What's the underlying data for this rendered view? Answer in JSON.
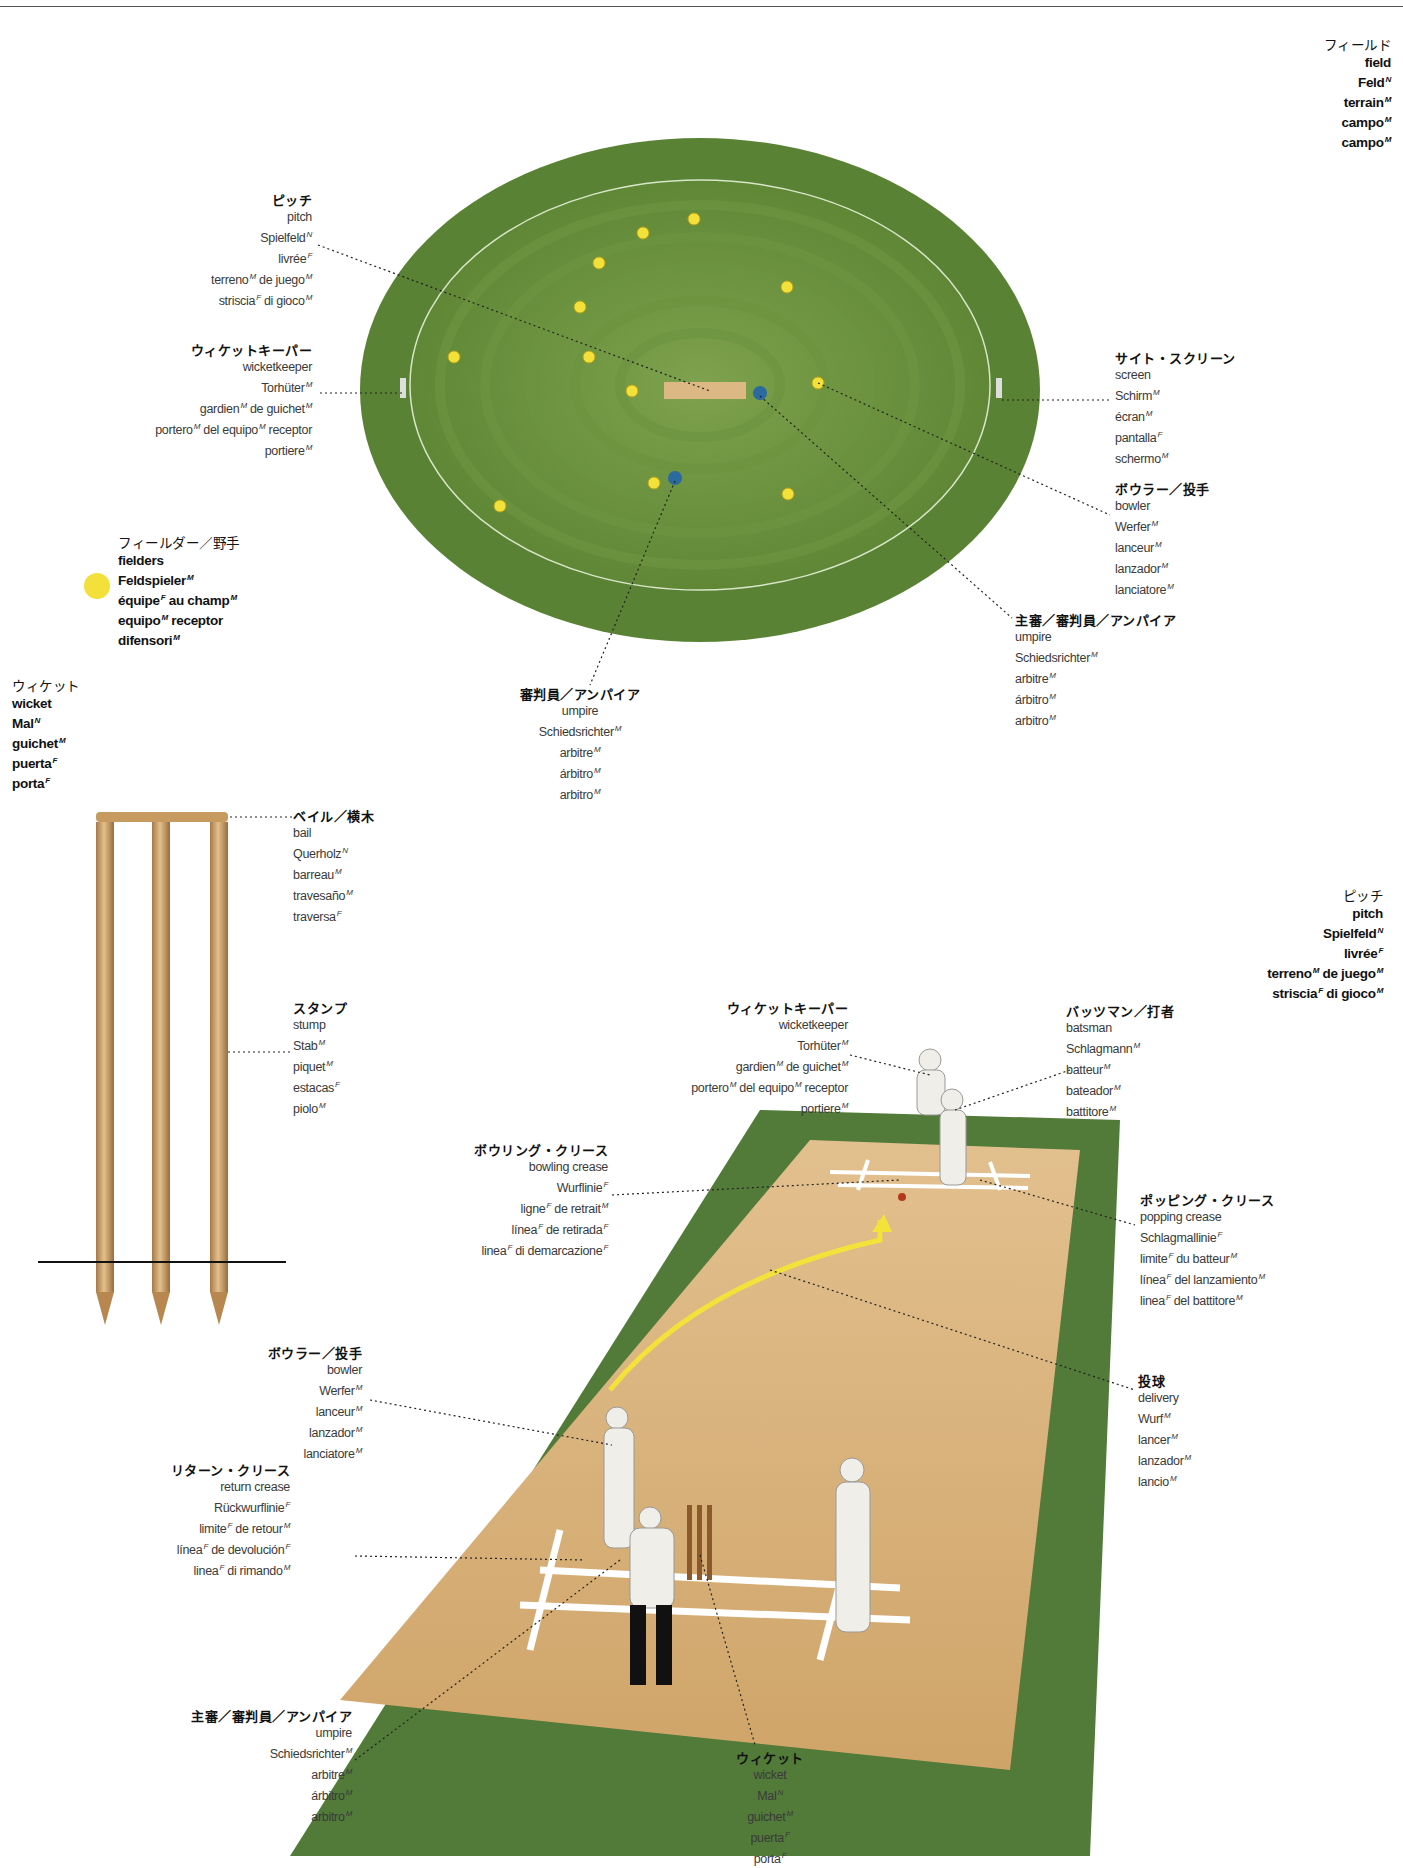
{
  "title_field": {
    "ja": "フィールド",
    "lines": [
      [
        "field",
        ""
      ],
      [
        "Feld",
        "N"
      ],
      [
        "terrain",
        "M"
      ],
      [
        "campo",
        "M"
      ],
      [
        "campo",
        "M"
      ]
    ]
  },
  "top_diagram": {
    "pitch": {
      "ja": "ピッチ",
      "lines": [
        [
          "pitch",
          ""
        ],
        [
          "Spielfeld",
          "N"
        ],
        [
          "livrée",
          "F"
        ],
        [
          "terreno",
          "M",
          " de juego",
          "M"
        ],
        [
          "striscia",
          "F",
          " di gioco",
          "M"
        ]
      ]
    },
    "wicketkeeper": {
      "ja": "ウィケットキーパー",
      "lines": [
        [
          "wicketkeeper",
          ""
        ],
        [
          "Torhüter",
          "M"
        ],
        [
          "gardien",
          "M",
          " de guichet",
          "M"
        ],
        [
          "portero",
          "M",
          " del equipo",
          "M",
          " receptor",
          ""
        ],
        [
          "portiere",
          "M"
        ]
      ]
    },
    "screen": {
      "ja": "サイト・スクリーン",
      "lines": [
        [
          "screen",
          ""
        ],
        [
          "Schirm",
          "M"
        ],
        [
          "écran",
          "M"
        ],
        [
          "pantalla",
          "F"
        ],
        [
          "schermo",
          "M"
        ]
      ]
    },
    "bowler": {
      "ja": "ボウラー／投手",
      "lines": [
        [
          "bowler",
          ""
        ],
        [
          "Werfer",
          "M"
        ],
        [
          "lanceur",
          "M"
        ],
        [
          "lanzador",
          "M"
        ],
        [
          "lanciatore",
          "M"
        ]
      ]
    },
    "fielders": {
      "ja": "フィールダー／野手",
      "lines": [
        [
          "fielders",
          ""
        ],
        [
          "Feldspieler",
          "M"
        ],
        [
          "équipe",
          "F",
          " au champ",
          "M"
        ],
        [
          "equipo",
          "M",
          " receptor",
          ""
        ],
        [
          "difensori",
          "M"
        ]
      ]
    },
    "umpire_main": {
      "ja": "主審／審判員／アンパイア",
      "lines": [
        [
          "umpire",
          ""
        ],
        [
          "Schiedsrichter",
          "M"
        ],
        [
          "arbitre",
          "M"
        ],
        [
          "árbitro",
          "M"
        ],
        [
          "arbitro",
          "M"
        ]
      ]
    },
    "umpire": {
      "ja": "審判員／アンパイア",
      "lines": [
        [
          "umpire",
          ""
        ],
        [
          "Schiedsrichter",
          "M"
        ],
        [
          "arbitre",
          "M"
        ],
        [
          "árbitro",
          "M"
        ],
        [
          "arbitro",
          "M"
        ]
      ]
    }
  },
  "wicket_section": {
    "wicket": {
      "ja": "ウィケット",
      "lines": [
        [
          "wicket",
          ""
        ],
        [
          "Mal",
          "N"
        ],
        [
          "guichet",
          "M"
        ],
        [
          "puerta",
          "F"
        ],
        [
          "porta",
          "F"
        ]
      ]
    },
    "bail": {
      "ja": "ベイル／横木",
      "lines": [
        [
          "bail",
          ""
        ],
        [
          "Querholz",
          "N"
        ],
        [
          "barreau",
          "M"
        ],
        [
          "travesaño",
          "M"
        ],
        [
          "traversa",
          "F"
        ]
      ]
    },
    "stump": {
      "ja": "スタンプ",
      "lines": [
        [
          "stump",
          ""
        ],
        [
          "Stab",
          "M"
        ],
        [
          "piquet",
          "M"
        ],
        [
          "estacas",
          "F"
        ],
        [
          "piolo",
          "M"
        ]
      ]
    }
  },
  "pitch_section": {
    "pitch_title": {
      "ja": "ピッチ",
      "lines": [
        [
          "pitch",
          ""
        ],
        [
          "Spielfeld",
          "N"
        ],
        [
          "livrée",
          "F"
        ],
        [
          "terreno",
          "M",
          " de juego",
          "M"
        ],
        [
          "striscia",
          "F",
          " di gioco",
          "M"
        ]
      ]
    },
    "wicketkeeper": {
      "ja": "ウィケットキーパー",
      "lines": [
        [
          "wicketkeeper",
          ""
        ],
        [
          "Torhüter",
          "M"
        ],
        [
          "gardien",
          "M",
          " de guichet",
          "M"
        ],
        [
          "portero",
          "M",
          " del equipo",
          "M",
          " receptor",
          ""
        ],
        [
          "portiere",
          "M"
        ]
      ]
    },
    "batsman": {
      "ja": "バッツマン／打者",
      "lines": [
        [
          "batsman",
          ""
        ],
        [
          "Schlagmann",
          "M"
        ],
        [
          "batteur",
          "M"
        ],
        [
          "bateador",
          "M"
        ],
        [
          "battitore",
          "M"
        ]
      ]
    },
    "bowling_crease": {
      "ja": "ボウリング・クリース",
      "lines": [
        [
          "bowling crease",
          ""
        ],
        [
          "Wurflinie",
          "F"
        ],
        [
          "ligne",
          "F",
          " de retrait",
          "M"
        ],
        [
          "línea",
          "F",
          " de retirada",
          "F"
        ],
        [
          "linea",
          "F",
          " di demarcazione",
          "F"
        ]
      ]
    },
    "popping_crease": {
      "ja": "ポッピング・クリース",
      "lines": [
        [
          "popping crease",
          ""
        ],
        [
          "Schlagmallinie",
          "F"
        ],
        [
          "limite",
          "F",
          " du batteur",
          "M"
        ],
        [
          "línea",
          "F",
          " del lanzamiento",
          "M"
        ],
        [
          "linea",
          "F",
          " del battitore",
          "M"
        ]
      ]
    },
    "bowler": {
      "ja": "ボウラー／投手",
      "lines": [
        [
          "bowler",
          ""
        ],
        [
          "Werfer",
          "M"
        ],
        [
          "lanceur",
          "M"
        ],
        [
          "lanzador",
          "M"
        ],
        [
          "lanciatore",
          "M"
        ]
      ]
    },
    "delivery": {
      "ja": "投球",
      "lines": [
        [
          "delivery",
          ""
        ],
        [
          "Wurf",
          "M"
        ],
        [
          "lancer",
          "M"
        ],
        [
          "lanzador",
          "M"
        ],
        [
          "lancio",
          "M"
        ]
      ]
    },
    "return_crease": {
      "ja": "リターン・クリース",
      "lines": [
        [
          "return crease",
          ""
        ],
        [
          "Rückwurflinie",
          "F"
        ],
        [
          "limite",
          "F",
          " de retour",
          "M"
        ],
        [
          "línea",
          "F",
          " de devolución",
          "F"
        ],
        [
          "linea",
          "F",
          " di rimando",
          "M"
        ]
      ]
    },
    "umpire_main": {
      "ja": "主審／審判員／アンパイア",
      "lines": [
        [
          "umpire",
          ""
        ],
        [
          "Schiedsrichter",
          "M"
        ],
        [
          "arbitre",
          "M"
        ],
        [
          "árbitro",
          "M"
        ],
        [
          "arbitro",
          "M"
        ]
      ]
    },
    "wicket": {
      "ja": "ウィケット",
      "lines": [
        [
          "wicket",
          ""
        ],
        [
          "Mal",
          "N"
        ],
        [
          "guichet",
          "M"
        ],
        [
          "puerta",
          "F"
        ],
        [
          "porta",
          "F"
        ]
      ]
    }
  },
  "colors": {
    "grass_dark": "#4f7a2c",
    "grass_light": "#7ea24d",
    "pitch": "#d9b27a",
    "fielder": "#f3e03a",
    "umpire_dot": "#2a6a9e",
    "wood": "#c99a5e"
  }
}
